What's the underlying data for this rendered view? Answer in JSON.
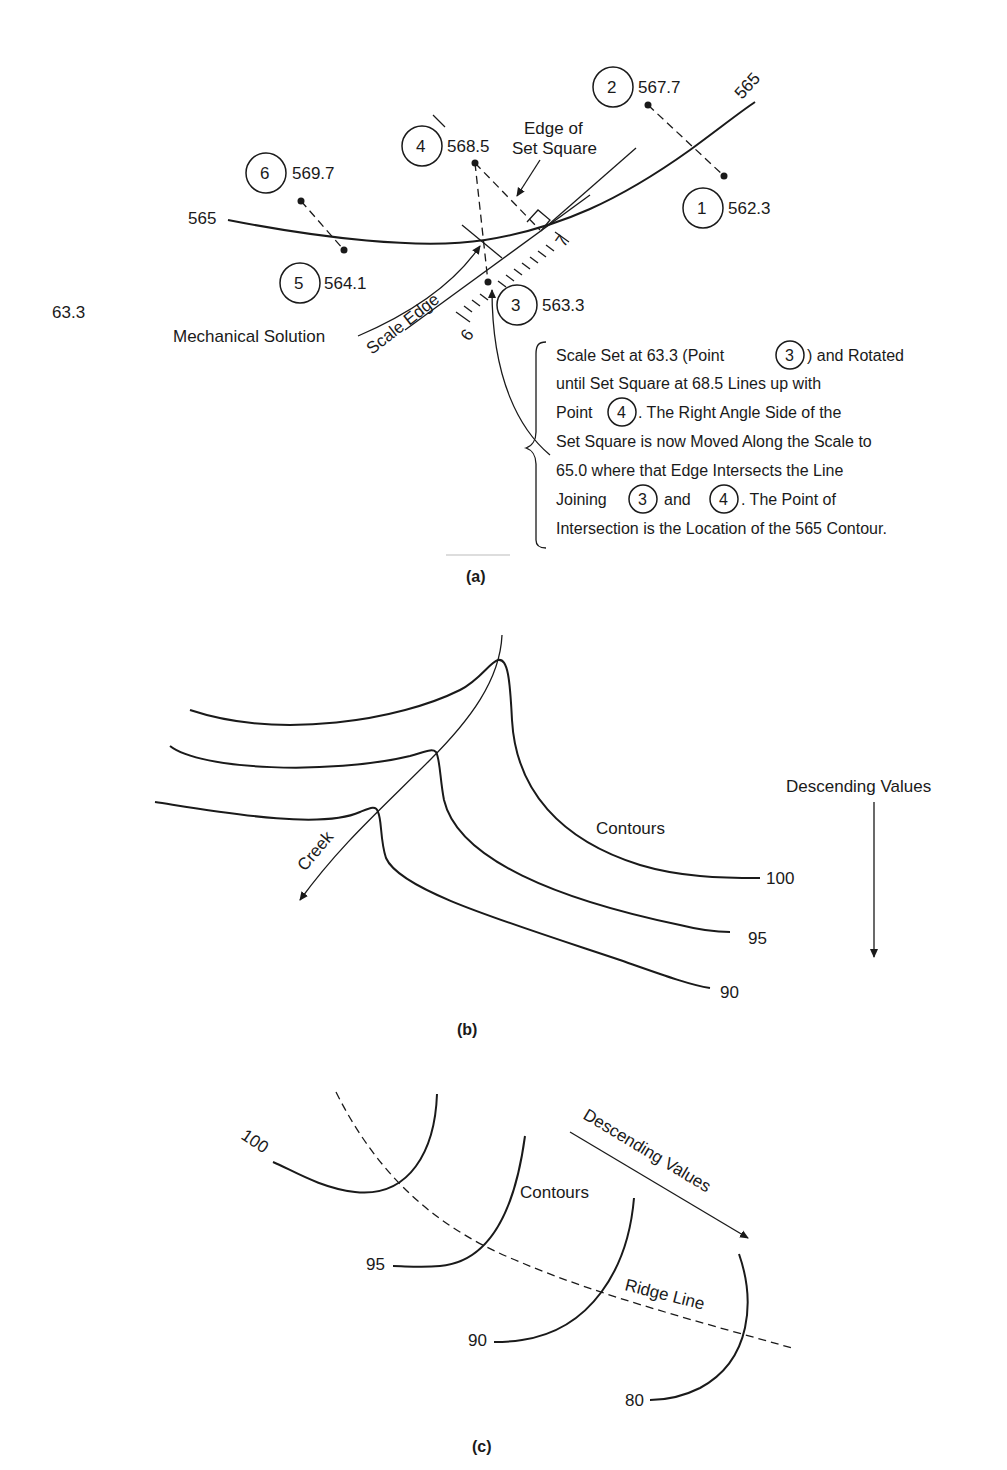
{
  "panel_a": {
    "caption": "(a)",
    "stray_label": "63.3",
    "contour_label_left": "565",
    "contour_label_right": "565",
    "points": [
      {
        "id": "1",
        "elevation": "562.3"
      },
      {
        "id": "2",
        "elevation": "567.7"
      },
      {
        "id": "3",
        "elevation": "563.3"
      },
      {
        "id": "4",
        "elevation": "568.5"
      },
      {
        "id": "5",
        "elevation": "564.1"
      },
      {
        "id": "6",
        "elevation": "569.7"
      }
    ],
    "edge_of_set_square": [
      "Edge of",
      "Set Square"
    ],
    "mechanical_solution": "Mechanical Solution",
    "scale_edge": "Scale Edge",
    "scale_tick_6": "6",
    "scale_tick_7": "7",
    "note": {
      "line1_pre": "Scale Set at 63.3 (Point",
      "line1_ref": "3",
      "line1_post": ") and Rotated",
      "line2": "until Set Square at 68.5 Lines up with",
      "line3_pre": "Point",
      "line3_ref": "4",
      "line3_post": ". The Right Angle Side of the",
      "line4": "Set Square is now Moved Along the Scale to",
      "line5": "65.0 where that Edge Intersects the Line",
      "line6_pre": "Joining",
      "line6_ref1": "3",
      "line6_mid": "and",
      "line6_ref2": "4",
      "line6_post": ". The Point of",
      "line7": "Intersection is the Location of the 565 Contour."
    }
  },
  "panel_b": {
    "caption": "(b)",
    "creek_label": "Creek",
    "contours_label": "Contours",
    "contour_values": [
      "100",
      "95",
      "90"
    ],
    "direction_label": "Descending Values"
  },
  "panel_c": {
    "caption": "(c)",
    "contours_label": "Contours",
    "contour_values": [
      "100",
      "95",
      "90",
      "80"
    ],
    "direction_label": "Descending Values",
    "ridge_label": "Ridge Line"
  }
}
